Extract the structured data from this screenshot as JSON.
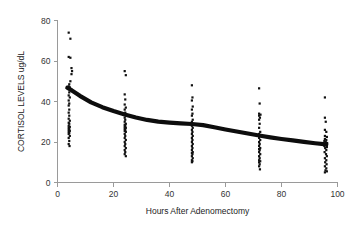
{
  "chart_data": {
    "type": "scatter",
    "title": "",
    "xlabel": "Hours After Adenomectomy",
    "ylabel": "CORTISOL LEVELS ug/dL",
    "xlim": [
      0,
      100
    ],
    "ylim": [
      0,
      80
    ],
    "xticks": [
      0,
      20,
      40,
      60,
      80,
      100
    ],
    "yticks": [
      0,
      20,
      40,
      60,
      80
    ],
    "grid": false,
    "legend": null,
    "marker_color": "#111111",
    "trend_color": "#0d0d0d",
    "axis_color": "#9a9a9a",
    "series": [
      {
        "name": "Cortisol measurements",
        "type": "scatter",
        "points": [
          [
            4,
            74.0
          ],
          [
            4.6,
            71.0
          ],
          [
            4,
            62.0
          ],
          [
            4.6,
            61.6
          ],
          [
            5.0,
            56.5
          ],
          [
            5.2,
            55.0
          ],
          [
            5.0,
            53.5
          ],
          [
            4.6,
            50.0
          ],
          [
            4.2,
            48.5
          ],
          [
            4.0,
            47.5
          ],
          [
            4.4,
            47.0
          ],
          [
            4.0,
            46.5
          ],
          [
            4.6,
            46.0
          ],
          [
            4.2,
            44.5
          ],
          [
            4.0,
            43.0
          ],
          [
            4.4,
            42.0
          ],
          [
            4.0,
            40.5
          ],
          [
            4.2,
            39.0
          ],
          [
            4.0,
            38.0
          ],
          [
            4.2,
            36.0
          ],
          [
            4.0,
            34.5
          ],
          [
            4.2,
            33.0
          ],
          [
            4.0,
            31.5
          ],
          [
            4.4,
            30.5
          ],
          [
            4.0,
            29.5
          ],
          [
            4.2,
            29.0
          ],
          [
            4.0,
            28.0
          ],
          [
            4.4,
            27.5
          ],
          [
            4.0,
            27.0
          ],
          [
            4.2,
            26.5
          ],
          [
            4.0,
            26.0
          ],
          [
            4.4,
            25.5
          ],
          [
            4.0,
            25.0
          ],
          [
            4.2,
            24.5
          ],
          [
            4.0,
            24.0
          ],
          [
            4.4,
            23.0
          ],
          [
            4.0,
            22.0
          ],
          [
            4.2,
            20.5
          ],
          [
            4.0,
            19.0
          ],
          [
            4.3,
            18.0
          ],
          [
            24.0,
            55.0
          ],
          [
            24.4,
            53.0
          ],
          [
            24.0,
            43.5
          ],
          [
            24.2,
            41.0
          ],
          [
            24.0,
            38.5
          ],
          [
            24.4,
            37.0
          ],
          [
            24.0,
            36.0
          ],
          [
            24.2,
            34.5
          ],
          [
            24.0,
            33.5
          ],
          [
            24.4,
            33.0
          ],
          [
            24.0,
            32.0
          ],
          [
            24.2,
            31.0
          ],
          [
            24.0,
            30.0
          ],
          [
            24.4,
            29.0
          ],
          [
            24.0,
            28.5
          ],
          [
            24.2,
            28.0
          ],
          [
            24.0,
            27.5
          ],
          [
            24.4,
            27.0
          ],
          [
            24.0,
            26.5
          ],
          [
            24.2,
            26.0
          ],
          [
            24.0,
            25.5
          ],
          [
            24.4,
            25.0
          ],
          [
            24.0,
            24.0
          ],
          [
            24.2,
            23.0
          ],
          [
            24.0,
            22.0
          ],
          [
            24.4,
            21.0
          ],
          [
            24.0,
            20.0
          ],
          [
            24.2,
            19.0
          ],
          [
            24.0,
            18.0
          ],
          [
            24.4,
            17.0
          ],
          [
            24.0,
            16.0
          ],
          [
            24.2,
            15.0
          ],
          [
            24.0,
            14.0
          ],
          [
            24.4,
            13.0
          ],
          [
            48.0,
            48.0
          ],
          [
            48.2,
            42.0
          ],
          [
            48.0,
            40.5
          ],
          [
            48.3,
            37.5
          ],
          [
            48.0,
            36.0
          ],
          [
            48.2,
            34.0
          ],
          [
            48.0,
            33.0
          ],
          [
            48.3,
            31.0
          ],
          [
            48.0,
            30.0
          ],
          [
            48.2,
            29.0
          ],
          [
            48.0,
            28.0
          ],
          [
            48.3,
            27.0
          ],
          [
            48.0,
            26.0
          ],
          [
            48.2,
            25.0
          ],
          [
            48.0,
            24.0
          ],
          [
            48.3,
            23.0
          ],
          [
            48.0,
            22.0
          ],
          [
            48.2,
            21.0
          ],
          [
            48.0,
            20.0
          ],
          [
            48.3,
            19.0
          ],
          [
            48.0,
            18.0
          ],
          [
            48.2,
            17.0
          ],
          [
            48.0,
            16.0
          ],
          [
            48.3,
            15.0
          ],
          [
            48.0,
            14.5
          ],
          [
            48.2,
            14.0
          ],
          [
            48.0,
            13.0
          ],
          [
            48.3,
            12.0
          ],
          [
            48.0,
            11.0
          ],
          [
            48.2,
            10.5
          ],
          [
            48.0,
            10.0
          ],
          [
            72.0,
            46.5
          ],
          [
            72.2,
            39.0
          ],
          [
            72.0,
            34.0
          ],
          [
            72.5,
            33.5
          ],
          [
            72.0,
            33.0
          ],
          [
            72.3,
            32.0
          ],
          [
            72.0,
            31.0
          ],
          [
            72.2,
            29.0
          ],
          [
            72.0,
            27.0
          ],
          [
            72.4,
            25.0
          ],
          [
            72.0,
            24.0
          ],
          [
            72.2,
            23.0
          ],
          [
            72.0,
            22.0
          ],
          [
            72.4,
            21.0
          ],
          [
            72.0,
            20.0
          ],
          [
            72.2,
            19.0
          ],
          [
            72.0,
            18.0
          ],
          [
            72.4,
            17.0
          ],
          [
            72.0,
            16.5
          ],
          [
            72.2,
            16.0
          ],
          [
            72.0,
            15.0
          ],
          [
            72.4,
            14.0
          ],
          [
            72.0,
            13.0
          ],
          [
            72.2,
            12.0
          ],
          [
            72.0,
            11.0
          ],
          [
            72.4,
            10.5
          ],
          [
            72.0,
            10.0
          ],
          [
            72.2,
            9.0
          ],
          [
            72.0,
            8.0
          ],
          [
            72.3,
            6.5
          ],
          [
            95.5,
            42.0
          ],
          [
            95.5,
            32.0
          ],
          [
            95.8,
            30.0
          ],
          [
            95.5,
            26.0
          ],
          [
            96.0,
            25.0
          ],
          [
            95.5,
            23.0
          ],
          [
            96.2,
            22.5
          ],
          [
            95.5,
            21.5
          ],
          [
            96.0,
            21.0
          ],
          [
            95.3,
            20.5
          ],
          [
            95.8,
            20.0
          ],
          [
            96.3,
            19.5
          ],
          [
            95.5,
            19.0
          ],
          [
            96.0,
            18.5
          ],
          [
            95.3,
            18.0
          ],
          [
            96.2,
            17.5
          ],
          [
            95.6,
            17.0
          ],
          [
            96.0,
            16.0
          ],
          [
            95.4,
            15.0
          ],
          [
            95.9,
            14.0
          ],
          [
            96.2,
            13.0
          ],
          [
            95.5,
            12.0
          ],
          [
            96.0,
            11.0
          ],
          [
            95.6,
            10.0
          ],
          [
            96.1,
            9.0
          ],
          [
            95.5,
            8.0
          ],
          [
            96.0,
            7.0
          ],
          [
            95.7,
            6.0
          ],
          [
            96.2,
            5.5
          ],
          [
            95.5,
            5.0
          ]
        ]
      },
      {
        "name": "Trend line",
        "type": "line",
        "points": [
          [
            3.5,
            46.8
          ],
          [
            5,
            45.6
          ],
          [
            8,
            42.8
          ],
          [
            12,
            39.6
          ],
          [
            16,
            37.2
          ],
          [
            20,
            35.3
          ],
          [
            24,
            33.6
          ],
          [
            28,
            32.1
          ],
          [
            32,
            30.9
          ],
          [
            36,
            30.1
          ],
          [
            40,
            29.6
          ],
          [
            44,
            29.2
          ],
          [
            48,
            28.9
          ],
          [
            52,
            28.3
          ],
          [
            56,
            27.3
          ],
          [
            60,
            26.2
          ],
          [
            64,
            25.2
          ],
          [
            68,
            24.2
          ],
          [
            72,
            23.2
          ],
          [
            76,
            22.3
          ],
          [
            80,
            21.5
          ],
          [
            84,
            20.8
          ],
          [
            88,
            20.1
          ],
          [
            92,
            19.4
          ],
          [
            96,
            18.8
          ]
        ]
      }
    ]
  }
}
